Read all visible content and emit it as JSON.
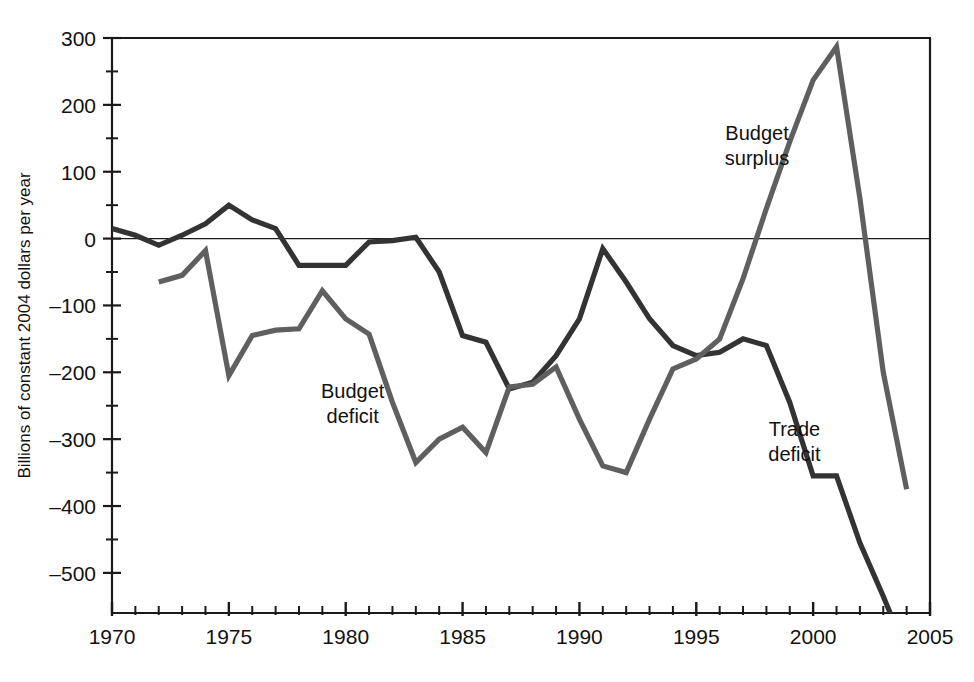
{
  "chart_data": {
    "type": "line",
    "title": "",
    "xlabel": "",
    "ylabel": "Billions of constant 2004 dollars per year",
    "xlim": [
      1970,
      2005
    ],
    "ylim": [
      -560,
      300
    ],
    "grid": false,
    "legend_position": "inline-annotations",
    "y_ticks": [
      300,
      200,
      100,
      0,
      -100,
      -200,
      -300,
      -400,
      -500
    ],
    "y_tick_labels": [
      "300",
      "200",
      "100",
      "0",
      "–100",
      "–200",
      "–300",
      "–400",
      "–500"
    ],
    "y_minor_ticks": [
      250,
      150,
      50,
      -50,
      -150,
      -250,
      -350,
      -450
    ],
    "x_ticks": [
      1970,
      1971,
      1972,
      1973,
      1974,
      1975,
      1976,
      1977,
      1978,
      1979,
      1980,
      1981,
      1982,
      1983,
      1984,
      1985,
      1986,
      1987,
      1988,
      1989,
      1990,
      1991,
      1992,
      1993,
      1994,
      1995,
      1996,
      1997,
      1998,
      1999,
      2000,
      2001,
      2002,
      2003,
      2004,
      2005
    ],
    "x_tick_labels": [
      "1970",
      "1975",
      "1980",
      "1985",
      "1990",
      "1995",
      "2000",
      "2005"
    ],
    "x_labeled_ticks": [
      1970,
      1975,
      1980,
      1985,
      1990,
      1995,
      2000,
      2005
    ],
    "zero_line": 0,
    "series": [
      {
        "name": "Trade deficit",
        "color": "#333333",
        "annotation": "Trade deficit",
        "annotation_line1": "Trade",
        "annotation_line2": "deficit",
        "annotation_x": 1999.2,
        "annotation_y": -295,
        "x": [
          1970,
          1971,
          1972,
          1973,
          1974,
          1975,
          1976,
          1977,
          1978,
          1979,
          1980,
          1981,
          1982,
          1983,
          1984,
          1985,
          1986,
          1987,
          1988,
          1989,
          1990,
          1991,
          1992,
          1993,
          1994,
          1995,
          1996,
          1997,
          1998,
          1999,
          2000,
          2001,
          2002,
          2003,
          2004
        ],
        "values": [
          15,
          5,
          -10,
          5,
          22,
          50,
          28,
          15,
          -40,
          -40,
          -40,
          -5,
          -3,
          2,
          -50,
          -145,
          -155,
          -225,
          -215,
          -175,
          -120,
          -15,
          -65,
          -120,
          -160,
          -175,
          -170,
          -150,
          -160,
          -245,
          -355,
          -355,
          -455,
          -535,
          -620
        ]
      },
      {
        "name": "Budget",
        "color": "#5f5f5f",
        "annotation_surplus": "Budget surplus",
        "annotation_surplus_line1": "Budget",
        "annotation_surplus_line2": "surplus",
        "annotation_surplus_x": 1997.6,
        "annotation_surplus_y": 148,
        "annotation_deficit": "Budget deficit",
        "annotation_deficit_line1": "Budget",
        "annotation_deficit_line2": "deficit",
        "annotation_deficit_x": 1980.3,
        "annotation_deficit_y": -238,
        "x": [
          1972,
          1973,
          1974,
          1975,
          1976,
          1977,
          1978,
          1979,
          1980,
          1981,
          1982,
          1983,
          1984,
          1985,
          1986,
          1987,
          1988,
          1989,
          1990,
          1991,
          1992,
          1993,
          1994,
          1995,
          1996,
          1997,
          1998,
          1999,
          2000,
          2001,
          2002,
          2003,
          2004
        ],
        "values": [
          -65,
          -55,
          -18,
          -205,
          -145,
          -137,
          -135,
          -78,
          -120,
          -143,
          -245,
          -335,
          -300,
          -282,
          -320,
          -222,
          -218,
          -192,
          -270,
          -340,
          -350,
          -270,
          -195,
          -180,
          -150,
          -60,
          45,
          145,
          237,
          287,
          60,
          -200,
          -375
        ]
      }
    ]
  }
}
